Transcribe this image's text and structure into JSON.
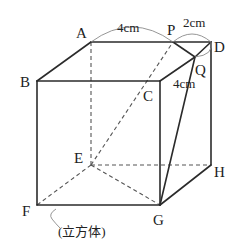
{
  "figure": {
    "type": "cube-diagram",
    "caption": "(立方体)",
    "vertices": {
      "A": "A",
      "B": "B",
      "C": "C",
      "D": "D",
      "E": "E",
      "F": "F",
      "G": "G",
      "H": "H",
      "P": "P",
      "Q": "Q"
    },
    "measurements": {
      "AP": "4cm",
      "PD": "2cm",
      "DQ": "4cm"
    },
    "colors": {
      "line": "#2b2b2b",
      "hidden_line": "#555555",
      "arc": "#8a8a8a",
      "background": "#ffffff"
    }
  }
}
